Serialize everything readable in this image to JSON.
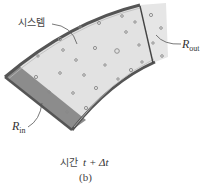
{
  "figure": {
    "system_label": "시스템",
    "r_out_label": "R",
    "r_out_sub": "out",
    "r_in_label": "R",
    "r_in_sub": "in",
    "time_prefix": "시간",
    "time_expr": "t + Δt",
    "panel_label": "(b)"
  },
  "colors": {
    "system_fill": "#e2e2e2",
    "r_in_fill": "#8c8c8c",
    "r_out_fill": "#e6e6e6",
    "boundary": "#555555",
    "particle": "#888888"
  }
}
